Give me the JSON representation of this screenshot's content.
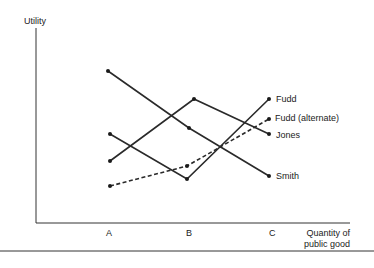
{
  "chart_data": {
    "type": "line",
    "title": "",
    "xlabel": "Quantity of public good",
    "ylabel": "Utility",
    "categories": [
      "A",
      "B",
      "C"
    ],
    "grid": false,
    "legend_position": "end-of-line labels",
    "ylim": [
      0,
      10
    ],
    "series": [
      {
        "name": "Smith",
        "style": "solid",
        "values": [
          8.0,
          4.9,
          2.4
        ],
        "px": [
          [
            108,
            71
          ],
          [
            189,
            128
          ],
          [
            269,
            176
          ]
        ]
      },
      {
        "name": "Jones",
        "style": "solid",
        "values": [
          3.2,
          6.6,
          4.8
        ],
        "px": [
          [
            110,
            161
          ],
          [
            194,
            99
          ],
          [
            269,
            134
          ]
        ]
      },
      {
        "name": "Fudd",
        "style": "solid",
        "values": [
          4.7,
          2.2,
          6.6
        ],
        "px": [
          [
            110,
            134
          ],
          [
            187,
            179
          ],
          [
            269,
            99
          ]
        ]
      },
      {
        "name": "Fudd (alternate)",
        "style": "dashed",
        "values": [
          1.9,
          3.0,
          5.5
        ],
        "px": [
          [
            110,
            186
          ],
          [
            187,
            166
          ],
          [
            269,
            119
          ]
        ]
      }
    ]
  },
  "labels": {
    "y_axis": "Utility",
    "x_axis_line1": "Quantity of",
    "x_axis_line2": "public good",
    "tick_a": "A",
    "tick_b": "B",
    "tick_c": "C",
    "fudd": "Fudd",
    "fudd_alt": "Fudd (alternate)",
    "jones": "Jones",
    "smith": "Smith"
  }
}
